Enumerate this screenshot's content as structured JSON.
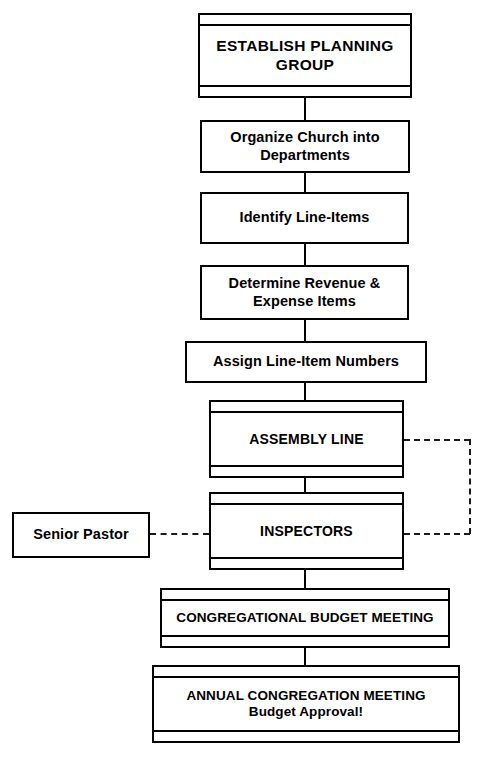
{
  "diagram": {
    "background_color": "#ffffff",
    "line_color": "#000000",
    "nodes": [
      {
        "id": "establish-planning-group",
        "label": "ESTABLISH PLANNING\nGROUP",
        "style": "banded"
      },
      {
        "id": "organize-church",
        "label": "Organize Church into\nDepartments",
        "style": "plain"
      },
      {
        "id": "identify-line-items",
        "label": "Identify Line-Items",
        "style": "plain"
      },
      {
        "id": "determine-revenue",
        "label": "Determine Revenue &\nExpense Items",
        "style": "plain"
      },
      {
        "id": "assign-numbers",
        "label": "Assign Line-Item Numbers",
        "style": "plain"
      },
      {
        "id": "assembly-line",
        "label": "ASSEMBLY LINE",
        "style": "banded"
      },
      {
        "id": "inspectors",
        "label": "INSPECTORS",
        "style": "banded"
      },
      {
        "id": "senior-pastor",
        "label": "Senior Pastor",
        "style": "plain"
      },
      {
        "id": "congregational-budget-meeting",
        "label": "CONGREGATIONAL BUDGET MEETING",
        "style": "banded"
      },
      {
        "id": "annual-congregation-meeting",
        "label": "ANNUAL CONGREGATION MEETING\nBudget Approval!",
        "style": "banded"
      }
    ],
    "connectors": [
      {
        "id": "establish-to-organize",
        "type": "solid",
        "orientation": "vertical"
      },
      {
        "id": "organize-to-identify",
        "type": "solid",
        "orientation": "vertical"
      },
      {
        "id": "identify-to-determine",
        "type": "solid",
        "orientation": "vertical"
      },
      {
        "id": "determine-to-assign",
        "type": "solid",
        "orientation": "vertical"
      },
      {
        "id": "assign-to-assembly",
        "type": "solid",
        "orientation": "vertical"
      },
      {
        "id": "assembly-to-inspectors",
        "type": "solid",
        "orientation": "vertical"
      },
      {
        "id": "inspectors-to-congregational",
        "type": "solid",
        "orientation": "vertical"
      },
      {
        "id": "congregational-to-annual",
        "type": "solid",
        "orientation": "vertical"
      },
      {
        "id": "senior-pastor-to-inspectors",
        "type": "dashed",
        "orientation": "horizontal"
      },
      {
        "id": "assembly-feedback-top",
        "type": "dashed",
        "orientation": "horizontal"
      },
      {
        "id": "assembly-feedback-side",
        "type": "dashed",
        "orientation": "vertical"
      },
      {
        "id": "assembly-feedback-bottom",
        "type": "dashed",
        "orientation": "horizontal"
      }
    ]
  }
}
